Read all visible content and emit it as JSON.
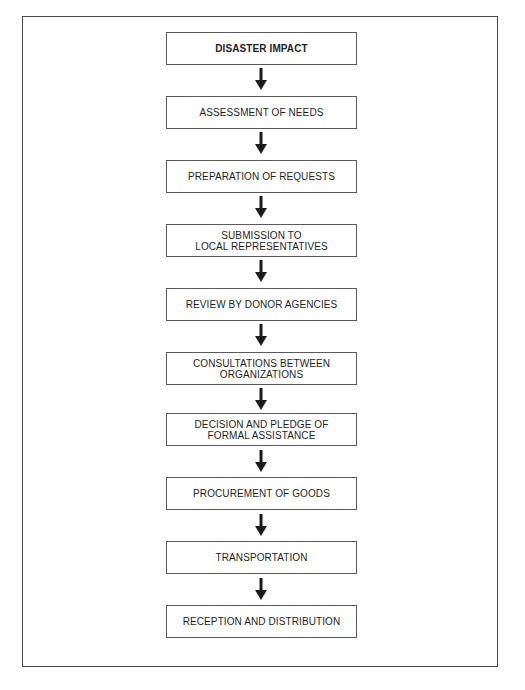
{
  "flowchart": {
    "steps": [
      {
        "label": "DISASTER IMPACT",
        "bold": true
      },
      {
        "label": "ASSESSMENT OF NEEDS"
      },
      {
        "label": "PREPARATION OF REQUESTS"
      },
      {
        "label": "SUBMISSION TO\nLOCAL REPRESENTATIVES"
      },
      {
        "label": "REVIEW BY DONOR AGENCIES"
      },
      {
        "label": "CONSULTATIONS BETWEEN\nORGANIZATIONS"
      },
      {
        "label": "DECISION AND PLEDGE OF\nFORMAL ASSISTANCE"
      },
      {
        "label": "PROCUREMENT OF GOODS"
      },
      {
        "label": "TRANSPORTATION"
      },
      {
        "label": "RECEPTION AND DISTRIBUTION"
      }
    ],
    "arrow_icon": "arrow-down-icon",
    "colors": {
      "border": "#5a5a5a",
      "frame": "#4a4a4a",
      "text": "#1e1e1e",
      "arrow": "#1a1a1a"
    }
  }
}
